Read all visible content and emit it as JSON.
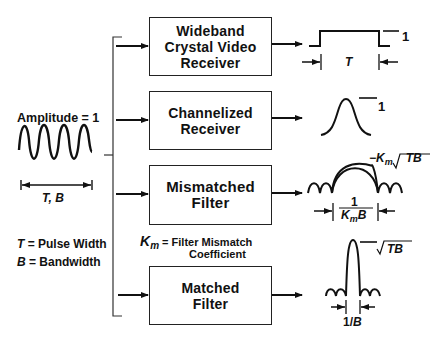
{
  "input": {
    "amplitude_label": "Amplitude = 1",
    "duration_label_T": "T",
    "duration_label_sep": ", ",
    "duration_label_B": "B"
  },
  "legend": {
    "t_symbol": "T",
    "t_desc": " = Pulse Width",
    "b_symbol": "B",
    "b_desc": " = Bandwidth",
    "km_symbol": "K",
    "km_sub": "m",
    "km_desc_line1": " = Filter Mismatch",
    "km_desc_line2": "Coefficient"
  },
  "blocks": [
    {
      "lines": [
        "Wideband",
        "Crystal Video",
        "Receiver"
      ]
    },
    {
      "lines": [
        "Channelized",
        "Receiver"
      ]
    },
    {
      "lines": [
        "Mismatched",
        "Filter"
      ]
    },
    {
      "lines": [
        "Matched",
        "Filter"
      ]
    }
  ],
  "outputs": {
    "wideband": {
      "amplitude": "1",
      "width": "T"
    },
    "channelized": {
      "amplitude": "1"
    },
    "mismatched": {
      "peak_prefix": "−K",
      "peak_sub": "m",
      "peak_root": "TB",
      "width_num": "1",
      "width_den_K": "K",
      "width_den_sub": "m",
      "width_den_B": "B"
    },
    "matched": {
      "peak_root": "TB",
      "width": "1/",
      "width_B": "B"
    }
  }
}
